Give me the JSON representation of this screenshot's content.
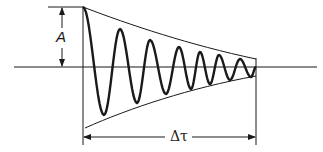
{
  "diagram": {
    "labels": {
      "amplitude": "A",
      "duration": "Δτ"
    },
    "colors": {
      "stroke": "#1a1a1a",
      "background": "#ffffff"
    },
    "geometry": {
      "baseline_y": 67,
      "baseline_x": [
        14,
        317
      ],
      "start_x": 83,
      "end_x": 256,
      "top_ref_y": 7,
      "bottom_arrow_y": 137
    },
    "wave": {
      "peaks": [
        [
          83,
          7
        ],
        [
          120,
          29
        ],
        [
          150,
          40
        ],
        [
          179,
          47
        ],
        [
          200,
          52
        ],
        [
          219,
          55
        ],
        [
          240,
          59
        ]
      ],
      "troughs": [
        [
          104,
          115
        ],
        [
          137,
          103
        ],
        [
          166,
          94
        ],
        [
          191,
          89
        ],
        [
          210,
          84
        ],
        [
          230,
          80
        ],
        [
          251,
          77
        ]
      ],
      "end_point": [
        256,
        67
      ]
    },
    "envelope": {
      "upper": [
        [
          83,
          7
        ],
        [
          256,
          59
        ]
      ],
      "lower": [
        [
          85,
          128
        ],
        [
          256,
          76
        ]
      ]
    }
  }
}
